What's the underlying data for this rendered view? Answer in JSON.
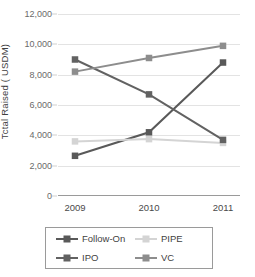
{
  "chart_data": {
    "type": "line",
    "title": "",
    "xlabel": "",
    "ylabel": "Tctal Raised ( USDM)",
    "categories": [
      "2009",
      "2010",
      "2011"
    ],
    "ylim": [
      0,
      12000
    ],
    "ytick_values": [
      0,
      2000,
      4000,
      6000,
      8000,
      10000,
      12000
    ],
    "ytick_labels": [
      "0",
      "2,000",
      "4,000",
      "6,000",
      "8,000",
      "10,000",
      "12,000"
    ],
    "grid": true,
    "legend_position": "bottom",
    "marker": "square",
    "series": [
      {
        "name": "Follow-On",
        "values": [
          2650,
          4200,
          8800
        ],
        "color": "#595959",
        "legend_order": 0
      },
      {
        "name": "PIPE",
        "values": [
          3600,
          3750,
          3500
        ],
        "color": "#d4d4d4",
        "legend_order": 1
      },
      {
        "name": "IPO",
        "values": [
          9000,
          6700,
          3700
        ],
        "color": "#626262",
        "legend_order": 2
      },
      {
        "name": "VC",
        "values": [
          8200,
          9100,
          9900
        ],
        "color": "#8d8d8d",
        "legend_order": 3
      }
    ]
  },
  "legend": {
    "items": [
      {
        "label": "Follow-On",
        "color": "#595959"
      },
      {
        "label": "PIPE",
        "color": "#d4d4d4"
      },
      {
        "label": "IPO",
        "color": "#626262"
      },
      {
        "label": "VC",
        "color": "#8d8d8d"
      }
    ]
  },
  "axes": {
    "y_title": "Tctal Raised ( USDM)",
    "x_labels": [
      "2009",
      "2010",
      "2011"
    ],
    "y_labels": [
      "12,000",
      "10,000",
      "8,000",
      "6,000",
      "4,000",
      "2,000",
      "0"
    ]
  },
  "colors": {
    "grid": "#e3e3e3",
    "axis": "#9a9a9a",
    "text": "#4a4a4a",
    "background": "#ffffff"
  }
}
